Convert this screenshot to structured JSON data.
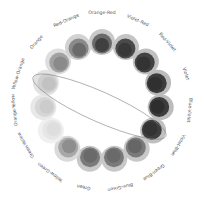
{
  "diagram": {
    "title": "",
    "center": [
      102,
      101
    ],
    "ring_radius": 59,
    "label_radius": 88,
    "complement_highlight": {
      "from": "Yellow-Orange",
      "to": "Violet-Blue",
      "stroke": "#8a8a8a"
    },
    "hues": [
      {
        "label": "Orange-Red",
        "angle": -90,
        "outer": "#c8c8c8",
        "mid": "#6a6a6a",
        "inner": "#404040"
      },
      {
        "label": "Violet-Red",
        "angle": -66,
        "outer": "#c4c4c4",
        "mid": "#4a4a4a",
        "inner": "#383838"
      },
      {
        "label": "Red-Violet",
        "angle": -42,
        "outer": "#c0c0c0",
        "mid": "#424242",
        "inner": "#333333"
      },
      {
        "label": "Violet",
        "angle": -18,
        "outer": "#bcbcbc",
        "mid": "#3c3c3c",
        "inner": "#303030"
      },
      {
        "label": "Blue-Violet",
        "angle": 6,
        "outer": "#bcbcbc",
        "mid": "#3c3c3c",
        "inner": "#2e2e2e"
      },
      {
        "label": "Violet-Blue",
        "angle": 30,
        "outer": "#c0c0c0",
        "mid": "#3e3e3e",
        "inner": "#333333"
      },
      {
        "label": "Green-Blue",
        "angle": 54,
        "outer": "#c8c8c8",
        "mid": "#7a7a7a",
        "inner": "#666666"
      },
      {
        "label": "Blue-Green",
        "angle": 78,
        "outer": "#c8c8c8",
        "mid": "#7a7a7a",
        "inner": "#6a6a6a"
      },
      {
        "label": "Green",
        "angle": 102,
        "outer": "#c8c8c8",
        "mid": "#7a7a7a",
        "inner": "#6a6a6a"
      },
      {
        "label": "Yellow-Green",
        "angle": 126,
        "outer": "#dadada",
        "mid": "#a8a8a8",
        "inner": "#8e8e8e"
      },
      {
        "label": "Green-Yellow",
        "angle": 150,
        "outer": "#f0f0f0",
        "mid": "#e6e6e6",
        "inner": "#dedede"
      },
      {
        "label": "Orange-Yellow",
        "angle": 174,
        "outer": "#e8e8e8",
        "mid": "#d6d6d6",
        "inner": "#cccccc"
      },
      {
        "label": "Yellow-Orange",
        "angle": 198,
        "outer": "#e2e2e2",
        "mid": "#cfcfcf",
        "inner": "#c2c2c2"
      },
      {
        "label": "Orange",
        "angle": 222,
        "outer": "#dedede",
        "mid": "#a2a2a2",
        "inner": "#8a8a8a"
      },
      {
        "label": "Red-Orange",
        "angle": 246,
        "outer": "#d2d2d2",
        "mid": "#8a8a8a",
        "inner": "#6a6a6a"
      }
    ]
  }
}
